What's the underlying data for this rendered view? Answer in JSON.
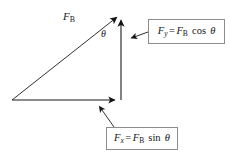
{
  "figure": {
    "background_color": "#ffffff",
    "stroke_color": "#1a1a1a",
    "box_border_color": "#8c8c8c"
  },
  "labels": {
    "resultant": {
      "symbol": "F",
      "subscript": "B",
      "text": "F_B"
    },
    "angle": {
      "symbol": "θ",
      "text": "θ"
    }
  },
  "equations": {
    "y_component": {
      "lhs_symbol": "F",
      "lhs_subscript": "y",
      "equals": "=",
      "rhs_symbol": "F",
      "rhs_subscript": "B",
      "function": "cos",
      "angle": "θ",
      "text": "F_y = F_B cos θ"
    },
    "x_component": {
      "lhs_symbol": "F",
      "lhs_subscript": "x",
      "equals": "=",
      "rhs_symbol": "F",
      "rhs_subscript": "B",
      "function": "sin",
      "angle": "θ",
      "text": "F_x = F_B sin θ"
    }
  },
  "geometry": {
    "origin": {
      "x": 12,
      "y": 100
    },
    "apex": {
      "x": 120,
      "y": 14
    },
    "corner": {
      "x": 121,
      "y": 100
    },
    "hypotenuse_arrow": "up-right",
    "vertical_arrow": "up",
    "horizontal_arrow": "right"
  },
  "leaders": {
    "y_leader": {
      "from": {
        "x": 148,
        "y": 33
      },
      "to": {
        "x": 128,
        "y": 39
      },
      "arrow": "left"
    },
    "x_leader": {
      "from": {
        "x": 113,
        "y": 127
      },
      "to": {
        "x": 97,
        "y": 104
      },
      "arrow": "up-left"
    }
  }
}
